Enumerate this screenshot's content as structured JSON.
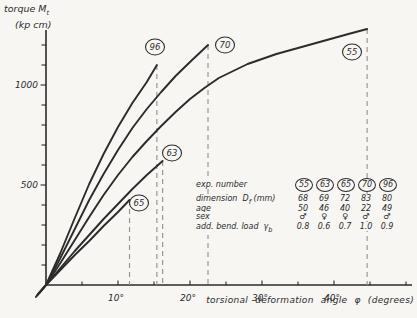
{
  "page": {
    "background": "#f7f6f3",
    "ink": "#2b2b2b",
    "dash_color": "#8f8f8f"
  },
  "chart_data": {
    "type": "line",
    "title": "",
    "ylabel": {
      "main": "torque M",
      "sub": "t",
      "unit": "(kp cm)"
    },
    "xlabel": "torsional deformation angle φ (degrees)",
    "xlim": [
      0,
      50.8
    ],
    "ylim": [
      0,
      1275
    ],
    "grid": false,
    "x_ticks": [
      {
        "v": 5
      },
      {
        "v": 10,
        "label": "10°"
      },
      {
        "v": 15
      },
      {
        "v": 20,
        "label": "20°"
      },
      {
        "v": 25
      },
      {
        "v": 30,
        "label": "30°"
      },
      {
        "v": 35
      },
      {
        "v": 40,
        "label": "40°"
      },
      {
        "v": 45
      },
      {
        "v": 50
      }
    ],
    "y_ticks": [
      {
        "v": 100
      },
      {
        "v": 200
      },
      {
        "v": 300
      },
      {
        "v": 400
      },
      {
        "v": 500,
        "label": "500"
      },
      {
        "v": 600
      },
      {
        "v": 700
      },
      {
        "v": 800
      },
      {
        "v": 900
      },
      {
        "v": 1000,
        "label": "1000"
      },
      {
        "v": 1100
      },
      {
        "v": 1200
      }
    ],
    "series": [
      {
        "name": "55",
        "label_pos": [
          352,
          52
        ],
        "drop": true,
        "points": [
          [
            -0.9,
            -40
          ],
          [
            0,
            0
          ],
          [
            2,
            110
          ],
          [
            4,
            225
          ],
          [
            6,
            340
          ],
          [
            8,
            450
          ],
          [
            10,
            550
          ],
          [
            12,
            640
          ],
          [
            14,
            720
          ],
          [
            16,
            795
          ],
          [
            18,
            865
          ],
          [
            20,
            930
          ],
          [
            22,
            985
          ],
          [
            24,
            1035
          ],
          [
            26,
            1070
          ],
          [
            28,
            1105
          ],
          [
            30,
            1130
          ],
          [
            32,
            1155
          ],
          [
            34,
            1175
          ],
          [
            36,
            1195
          ],
          [
            38,
            1215
          ],
          [
            40,
            1235
          ],
          [
            42,
            1255
          ],
          [
            44.6,
            1280
          ]
        ]
      },
      {
        "name": "70",
        "label_pos": [
          225,
          45
        ],
        "drop": true,
        "points": [
          [
            -1.1,
            -45
          ],
          [
            0,
            0
          ],
          [
            2,
            135
          ],
          [
            4,
            280
          ],
          [
            6,
            425
          ],
          [
            8,
            555
          ],
          [
            10,
            675
          ],
          [
            12,
            785
          ],
          [
            14,
            880
          ],
          [
            16,
            965
          ],
          [
            18,
            1045
          ],
          [
            20,
            1115
          ],
          [
            22.5,
            1200
          ]
        ]
      },
      {
        "name": "96",
        "label_pos": [
          155,
          47
        ],
        "drop": true,
        "points": [
          [
            -1.3,
            -55
          ],
          [
            0,
            0
          ],
          [
            2,
            160
          ],
          [
            4,
            335
          ],
          [
            6,
            505
          ],
          [
            8,
            655
          ],
          [
            10,
            790
          ],
          [
            12,
            910
          ],
          [
            14,
            1015
          ],
          [
            15.4,
            1100
          ]
        ]
      },
      {
        "name": "63",
        "label_pos": [
          172,
          153
        ],
        "drop": true,
        "points": [
          [
            -1.2,
            -50
          ],
          [
            0,
            0
          ],
          [
            2,
            85
          ],
          [
            4,
            170
          ],
          [
            6,
            250
          ],
          [
            8,
            330
          ],
          [
            10,
            405
          ],
          [
            12,
            480
          ],
          [
            14,
            550
          ],
          [
            16.2,
            620
          ]
        ]
      },
      {
        "name": "65",
        "label_pos": [
          139,
          203
        ],
        "drop": true,
        "points": [
          [
            -1.4,
            -60
          ],
          [
            0,
            0
          ],
          [
            2,
            75
          ],
          [
            4,
            150
          ],
          [
            6,
            220
          ],
          [
            8,
            295
          ],
          [
            10,
            365
          ],
          [
            11.6,
            425
          ]
        ]
      }
    ]
  },
  "legend": {
    "columns": [
      "55",
      "63",
      "65",
      "70",
      "96"
    ],
    "rows": [
      {
        "label": "exp. number",
        "type": "circled",
        "values": [
          "55",
          "63",
          "65",
          "70",
          "96"
        ]
      },
      {
        "label": "dimension  D",
        "sub": "f",
        "suffix": " (mm)",
        "values": [
          "68",
          "69",
          "72",
          "83",
          "80"
        ]
      },
      {
        "label": "age",
        "values": [
          "50",
          "46",
          "40",
          "22",
          "49"
        ]
      },
      {
        "label": "sex",
        "values": [
          "♂",
          "♀",
          "♀",
          "♂",
          "♂"
        ]
      },
      {
        "label": "add. bend. load  γ",
        "sub": "b",
        "suffix": "",
        "values": [
          "0.8",
          "0.6",
          "0.7",
          "1.0",
          "0.9"
        ]
      }
    ]
  }
}
